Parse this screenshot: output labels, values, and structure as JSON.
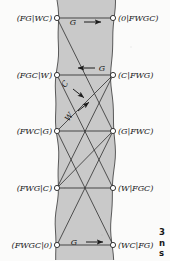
{
  "figure": {
    "kind": "state-transition-graph",
    "band": {
      "fill": "#c9c9c9",
      "left_x": 57,
      "right_x": 113
    },
    "node_radius": 2.6,
    "stroke": "#2e2e2e",
    "nodes": {
      "left": [
        {
          "id": "L1",
          "label": "(FG|WC)",
          "x": 57,
          "y": 18
        },
        {
          "id": "L2",
          "label": "(FGC|W)",
          "x": 57,
          "y": 75
        },
        {
          "id": "L3",
          "label": "(FWC|G)",
          "x": 57,
          "y": 131
        },
        {
          "id": "L4",
          "label": "(FWG|C)",
          "x": 57,
          "y": 188
        },
        {
          "id": "L5",
          "label": "(FWGC|0)",
          "x": 57,
          "y": 245
        }
      ],
      "right": [
        {
          "id": "R1",
          "label": "(0|FWGC)",
          "x": 113,
          "y": 18
        },
        {
          "id": "R2",
          "label": "(C|FWG)",
          "x": 113,
          "y": 75
        },
        {
          "id": "R3",
          "label": "(G|FWC)",
          "x": 113,
          "y": 131
        },
        {
          "id": "R4",
          "label": "(W|FGC)",
          "x": 113,
          "y": 188
        },
        {
          "id": "R5",
          "label": "(WC|FG)",
          "x": 113,
          "y": 245
        }
      ]
    },
    "edges": [
      {
        "from": "L1",
        "to": "R1",
        "type": "horizontal"
      },
      {
        "from": "L2",
        "to": "R2",
        "type": "horizontal"
      },
      {
        "from": "L3",
        "to": "R3",
        "type": "horizontal"
      },
      {
        "from": "L4",
        "to": "R4",
        "type": "horizontal"
      },
      {
        "from": "L5",
        "to": "R5",
        "type": "horizontal"
      },
      {
        "from": "L1",
        "to": "R3",
        "type": "diagonal"
      },
      {
        "from": "L2",
        "to": "R4",
        "type": "diagonal"
      },
      {
        "from": "L3",
        "to": "R2",
        "type": "diagonal"
      },
      {
        "from": "L3",
        "to": "R5",
        "type": "diagonal"
      },
      {
        "from": "L4",
        "to": "R2",
        "type": "diagonal"
      },
      {
        "from": "L4",
        "to": "R3",
        "type": "diagonal"
      },
      {
        "from": "L5",
        "to": "R3",
        "type": "diagonal"
      }
    ],
    "edge_labels": [
      {
        "id": "arrow-g-top",
        "text": "G",
        "x": 73,
        "y": 22,
        "arrow": "right",
        "arrow_x": 84,
        "arrow_y": 22,
        "arrow_len": 17
      },
      {
        "id": "arrow-g-upper-mid",
        "text": "G",
        "x": 102,
        "y": 68,
        "arrow": "left",
        "arrow_x": 78,
        "arrow_y": 68,
        "arrow_len": 17
      },
      {
        "id": "arrow-c-diag",
        "text": "C",
        "x": 65,
        "y": 84,
        "arrow": "diag-down-right",
        "arrow_x": 73,
        "arrow_y": 89,
        "arrow_len": 14,
        "rotate": -55
      },
      {
        "id": "arrow-w-diag",
        "text": "W",
        "x": 69,
        "y": 117,
        "arrow": "diag-up-right",
        "arrow_x": 78,
        "arrow_y": 111,
        "arrow_len": 14,
        "rotate": -55
      },
      {
        "id": "arrow-g-bottom",
        "text": "G",
        "x": 74,
        "y": 242,
        "arrow": "right",
        "arrow_x": 86,
        "arrow_y": 242,
        "arrow_len": 17
      }
    ],
    "corner_text": {
      "line1": "3",
      "line2": "n",
      "line3": "s"
    }
  }
}
